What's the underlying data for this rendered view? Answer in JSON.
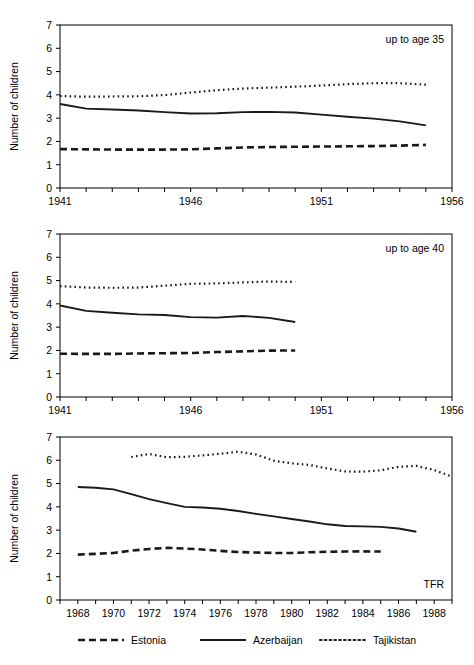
{
  "figure": {
    "background_color": "#ffffff",
    "line_color": "#1a1a1a",
    "y_axis_title": "Number of children",
    "y_ticks": [
      0,
      1,
      2,
      3,
      4,
      5,
      6,
      7
    ],
    "ylim": [
      0,
      7
    ]
  },
  "legend": {
    "position": "bottom-center",
    "entries": [
      {
        "label": "Estonia",
        "style": "dashed",
        "dash_pattern": "7,4"
      },
      {
        "label": "Azerbaijan",
        "style": "solid",
        "dash_pattern": "none"
      },
      {
        "label": "Tajikistan",
        "style": "dotted",
        "dash_pattern": "1.6,3.2"
      }
    ]
  },
  "chart_data": [
    {
      "id": "panel-up-to-age-35",
      "type": "line",
      "title": "up to age 35",
      "annotation": "up to age 35",
      "xlabel": "",
      "ylabel": "Number of children",
      "xlim": [
        1941,
        1956
      ],
      "ylim": [
        0,
        7
      ],
      "grid": false,
      "x_tick_step": 1,
      "x_label_step": 5,
      "x_tick_labels": [
        "1941",
        "1946",
        "1951",
        "1956"
      ],
      "x_tick_label_values": [
        1941,
        1946,
        1951,
        1956
      ],
      "y_tick_labels": [
        "0",
        "1",
        "2",
        "3",
        "4",
        "5",
        "6",
        "7"
      ],
      "series": [
        {
          "name": "Estonia",
          "style": "dashed",
          "x": [
            1941,
            1942,
            1943,
            1944,
            1945,
            1946,
            1947,
            1948,
            1949,
            1950,
            1951,
            1952,
            1953,
            1954,
            1955
          ],
          "values": [
            1.67,
            1.66,
            1.65,
            1.65,
            1.65,
            1.66,
            1.7,
            1.74,
            1.76,
            1.77,
            1.78,
            1.79,
            1.8,
            1.82,
            1.85
          ]
        },
        {
          "name": "Azerbaijan",
          "style": "solid",
          "x": [
            1941,
            1942,
            1943,
            1944,
            1945,
            1946,
            1947,
            1948,
            1949,
            1950,
            1951,
            1952,
            1953,
            1954,
            1955
          ],
          "values": [
            3.61,
            3.41,
            3.37,
            3.33,
            3.26,
            3.2,
            3.21,
            3.26,
            3.27,
            3.24,
            3.15,
            3.06,
            2.98,
            2.86,
            2.69
          ]
        },
        {
          "name": "Tajikistan",
          "style": "dotted",
          "x": [
            1941,
            1942,
            1943,
            1944,
            1945,
            1946,
            1947,
            1948,
            1949,
            1950,
            1951,
            1952,
            1953,
            1954,
            1955
          ],
          "values": [
            3.95,
            3.92,
            3.93,
            3.94,
            3.99,
            4.1,
            4.2,
            4.27,
            4.31,
            4.35,
            4.4,
            4.46,
            4.5,
            4.5,
            4.44
          ]
        }
      ]
    },
    {
      "id": "panel-up-to-age-40",
      "type": "line",
      "title": "up to age 40",
      "annotation": "up to age 40",
      "xlabel": "",
      "ylabel": "Number of children",
      "xlim": [
        1941,
        1956
      ],
      "ylim": [
        0,
        7
      ],
      "grid": false,
      "x_tick_step": 1,
      "x_label_step": 5,
      "x_tick_labels": [
        "1941",
        "1946",
        "1951",
        "1956"
      ],
      "x_tick_label_values": [
        1941,
        1946,
        1951,
        1956
      ],
      "y_tick_labels": [
        "0",
        "1",
        "2",
        "3",
        "4",
        "5",
        "6",
        "7"
      ],
      "series": [
        {
          "name": "Estonia",
          "style": "dashed",
          "x": [
            1941,
            1942,
            1943,
            1944,
            1945,
            1946,
            1947,
            1948,
            1949,
            1950
          ],
          "values": [
            1.86,
            1.85,
            1.85,
            1.87,
            1.88,
            1.89,
            1.93,
            1.96,
            1.99,
            2.0
          ]
        },
        {
          "name": "Azerbaijan",
          "style": "solid",
          "x": [
            1941,
            1942,
            1943,
            1944,
            1945,
            1946,
            1947,
            1948,
            1949,
            1950
          ],
          "values": [
            3.93,
            3.7,
            3.62,
            3.55,
            3.52,
            3.43,
            3.41,
            3.48,
            3.4,
            3.22
          ]
        },
        {
          "name": "Tajikistan",
          "style": "dotted",
          "x": [
            1941,
            1942,
            1943,
            1944,
            1945,
            1946,
            1947,
            1948,
            1949,
            1950
          ],
          "values": [
            4.76,
            4.7,
            4.69,
            4.7,
            4.78,
            4.86,
            4.88,
            4.92,
            4.96,
            4.94
          ]
        }
      ]
    },
    {
      "id": "panel-tfr",
      "type": "line",
      "title": "TFR",
      "annotation": "TFR",
      "xlabel": "",
      "ylabel": "Number of children",
      "xlim": [
        1967,
        1989
      ],
      "ylim": [
        0,
        7
      ],
      "grid": false,
      "x_tick_step": 1,
      "x_label_step": 2,
      "x_tick_labels": [
        "1968",
        "1970",
        "1972",
        "1974",
        "1976",
        "1978",
        "1980",
        "1982",
        "1984",
        "1986",
        "1988"
      ],
      "x_tick_label_values": [
        1968,
        1970,
        1972,
        1974,
        1976,
        1978,
        1980,
        1982,
        1984,
        1986,
        1988
      ],
      "y_tick_labels": [
        "0",
        "1",
        "2",
        "3",
        "4",
        "5",
        "6",
        "7"
      ],
      "series": [
        {
          "name": "Estonia",
          "style": "dashed",
          "x": [
            1968,
            1969,
            1970,
            1971,
            1972,
            1973,
            1974,
            1975,
            1976,
            1977,
            1978,
            1979,
            1980,
            1981,
            1982,
            1983,
            1984,
            1985
          ],
          "values": [
            1.95,
            1.98,
            2.02,
            2.12,
            2.19,
            2.24,
            2.21,
            2.17,
            2.11,
            2.06,
            2.04,
            2.02,
            2.02,
            2.05,
            2.07,
            2.08,
            2.09,
            2.08
          ]
        },
        {
          "name": "Azerbaijan",
          "style": "solid",
          "x": [
            1968,
            1969,
            1970,
            1971,
            1972,
            1973,
            1974,
            1975,
            1976,
            1977,
            1978,
            1979,
            1980,
            1981,
            1982,
            1983,
            1984,
            1985,
            1986,
            1987
          ],
          "values": [
            4.85,
            4.82,
            4.75,
            4.55,
            4.33,
            4.16,
            4.0,
            3.97,
            3.92,
            3.82,
            3.7,
            3.59,
            3.48,
            3.37,
            3.25,
            3.18,
            3.16,
            3.14,
            3.07,
            2.93
          ]
        },
        {
          "name": "Tajikistan",
          "style": "dotted",
          "x": [
            1971,
            1972,
            1973,
            1974,
            1975,
            1976,
            1977,
            1978,
            1979,
            1980,
            1981,
            1982,
            1983,
            1984,
            1985,
            1986,
            1987,
            1988,
            1989
          ],
          "values": [
            6.14,
            6.27,
            6.13,
            6.15,
            6.21,
            6.28,
            6.37,
            6.25,
            5.98,
            5.87,
            5.8,
            5.65,
            5.52,
            5.51,
            5.57,
            5.72,
            5.76,
            5.58,
            5.3
          ]
        }
      ]
    }
  ]
}
